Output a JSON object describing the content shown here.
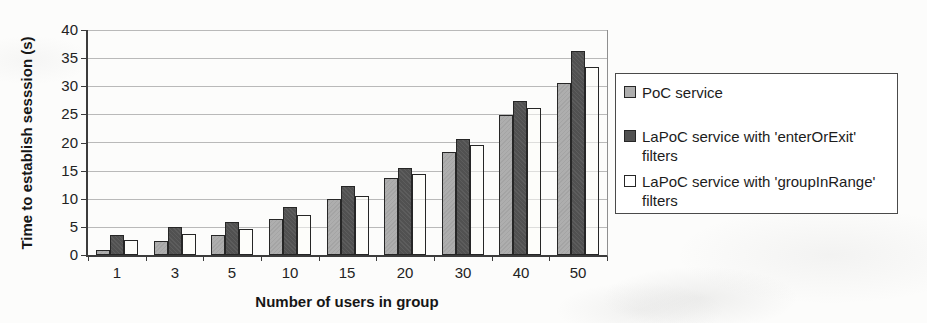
{
  "chart_data": {
    "type": "bar",
    "title": "",
    "xlabel": "Number of users in group",
    "ylabel": "Time to establish sesssion (s)",
    "categories": [
      "1",
      "3",
      "5",
      "10",
      "15",
      "20",
      "30",
      "40",
      "50"
    ],
    "series": [
      {
        "name": "PoC service",
        "color": "#aeaeae",
        "values": [
          0.8,
          2.4,
          3.5,
          6.4,
          10.0,
          13.7,
          18.4,
          24.9,
          30.5
        ]
      },
      {
        "name": "LaPoC service with 'enterOrExit' filters",
        "color": "#515151",
        "values": [
          3.5,
          5.0,
          5.8,
          8.6,
          12.3,
          15.5,
          20.6,
          27.3,
          36.3
        ]
      },
      {
        "name": "LaPoC service with 'groupInRange' filters",
        "color": "#ffffff",
        "values": [
          2.7,
          3.7,
          4.6,
          7.1,
          10.4,
          14.4,
          19.6,
          26.1,
          33.5
        ]
      }
    ],
    "ylim": [
      0,
      40
    ],
    "ytick_step": 5,
    "grid": true,
    "legend_position": "right",
    "colors": {
      "axis": "#3c3c3c",
      "gridline": "#b9b9b9",
      "bar_border": "#262626",
      "text": "#1f1f1f"
    }
  }
}
